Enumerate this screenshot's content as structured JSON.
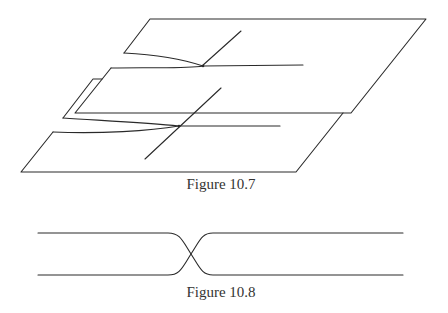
{
  "figures": [
    {
      "id": "fig-10-7",
      "caption": "Figure 10.7",
      "description": "Three stacked parallelogram sheets in perspective; two sheets meet in cusp curves with transverse lines",
      "colors": {
        "stroke": "#2a2a2a",
        "background": "#ffffff"
      }
    },
    {
      "id": "fig-10-8",
      "caption": "Figure 10.8",
      "description": "Two horizontal strands that cross once in the middle",
      "colors": {
        "stroke": "#2a2a2a",
        "background": "#ffffff"
      }
    }
  ]
}
